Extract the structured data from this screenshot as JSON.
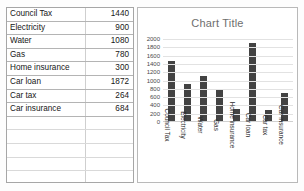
{
  "spreadsheet": {
    "rows": [
      {
        "label": "Council Tax",
        "value": "1440"
      },
      {
        "label": "Electricity",
        "value": "900"
      },
      {
        "label": "Water",
        "value": "1080"
      },
      {
        "label": "Gas",
        "value": "780"
      },
      {
        "label": "Home insurance",
        "value": "300"
      },
      {
        "label": "Car loan",
        "value": "1872"
      },
      {
        "label": "Car tax",
        "value": "264"
      },
      {
        "label": "Car insurance",
        "value": "684"
      }
    ],
    "empty_row_count": 5
  },
  "chart_data": {
    "type": "bar",
    "title": "Chart Title",
    "xlabel": "",
    "ylabel": "",
    "categories": [
      "Council Tax",
      "Electricity",
      "Water",
      "Gas",
      "Home insurance",
      "Car loan",
      "Car tax",
      "Car insurance"
    ],
    "values": [
      1440,
      900,
      1080,
      780,
      300,
      1872,
      264,
      684
    ],
    "ylim": [
      0,
      2000
    ],
    "ytick_labels": [
      "2000",
      "1800",
      "1600",
      "1400",
      "1200",
      "1000",
      "800",
      "600",
      "400",
      "200",
      "0"
    ],
    "ytick_values": [
      2000,
      1800,
      1600,
      1400,
      1200,
      1000,
      800,
      600,
      400,
      200,
      0
    ],
    "grid": true,
    "legend": false,
    "bar_color": "#434343",
    "gridline_color": "#e2e2e2",
    "title_color": "#6e6e6e"
  }
}
